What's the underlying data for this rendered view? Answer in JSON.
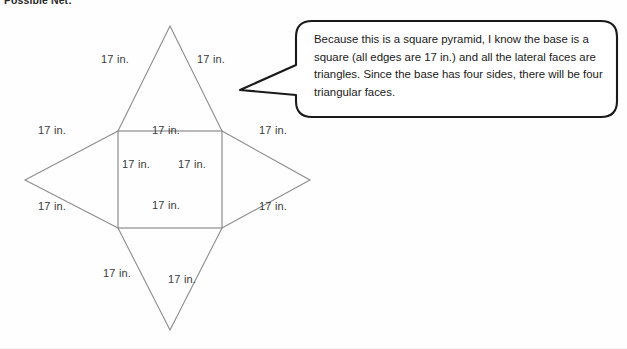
{
  "page": {
    "heading": "Possible Net:",
    "background_color": "#fefefe",
    "line_color": "#8c8c8c",
    "text_color": "#3a3a3a",
    "callout_border_color": "#1a1a1a"
  },
  "net": {
    "figure_name": "square-pyramid-net",
    "labels": [
      {
        "id": "top-left-slant",
        "text": "17 in.",
        "x": 101,
        "y": 61
      },
      {
        "id": "top-right-slant",
        "text": "17 in.",
        "x": 197,
        "y": 61
      },
      {
        "id": "left-upper-slant",
        "text": "17 in.",
        "x": 38,
        "y": 131
      },
      {
        "id": "left-lower-slant",
        "text": "17 in.",
        "x": 38,
        "y": 207
      },
      {
        "id": "right-upper-slant",
        "text": "17 in.",
        "x": 259,
        "y": 131
      },
      {
        "id": "right-lower-slant",
        "text": "17 in.",
        "x": 259,
        "y": 207
      },
      {
        "id": "square-top-edge",
        "text": "17 in.",
        "x": 152,
        "y": 131
      },
      {
        "id": "square-left-edge",
        "text": "17 in.",
        "x": 122,
        "y": 165
      },
      {
        "id": "square-right-edge",
        "text": "17 in.",
        "x": 178,
        "y": 165
      },
      {
        "id": "square-bottom-edge",
        "text": "17 in.",
        "x": 152,
        "y": 206
      },
      {
        "id": "bottom-left-slant",
        "text": "17 in.",
        "x": 103,
        "y": 274
      },
      {
        "id": "bottom-right-slant",
        "text": "17 in.",
        "x": 168,
        "y": 280
      }
    ]
  },
  "callout": {
    "speaker_note": "Because this is a square pyramid, I know the base is a square (all edges are 17 in.) and all the lateral faces are triangles.  Since the base has four sides, there will be four triangular faces."
  }
}
